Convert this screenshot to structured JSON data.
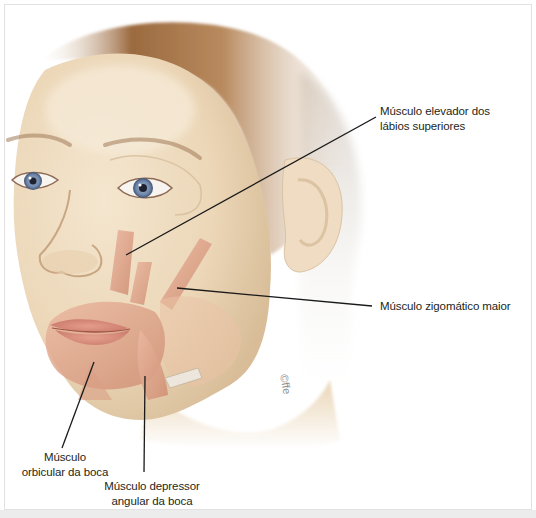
{
  "figure": {
    "watermark": "©ffe",
    "colors": {
      "skin": "#efdcc0",
      "skin_shadow": "#d9bf9a",
      "muscle": "#e2a98f",
      "muscle_dark": "#c97f66",
      "hair": "#8a5a33",
      "hair_light": "#e8e0d4",
      "lips": "#d88a7c",
      "iris": "#6f87a8",
      "leader_line": "#1a1a1a",
      "label_text": "#231f20",
      "frame_border": "#e2e2e2"
    }
  },
  "labels": [
    {
      "id": "elevador",
      "line1": "Músculo elevador dos",
      "line2": "lábios superiores",
      "line": {
        "x1": 376,
        "y1": 117,
        "x2": 126,
        "y2": 255
      }
    },
    {
      "id": "zigomatico",
      "line1": "Músculo zigomático maior",
      "line2": "",
      "line": {
        "x1": 177,
        "y1": 288,
        "x2": 372,
        "y2": 306
      }
    },
    {
      "id": "orbicular",
      "line1": "Músculo",
      "line2": "orbicular da boca",
      "line": {
        "x1": 94,
        "y1": 362,
        "x2": 62,
        "y2": 448
      }
    },
    {
      "id": "depressor",
      "line1": "Músculo depressor",
      "line2": "angular da boca",
      "line": {
        "x1": 145,
        "y1": 376,
        "x2": 144,
        "y2": 472
      }
    }
  ]
}
